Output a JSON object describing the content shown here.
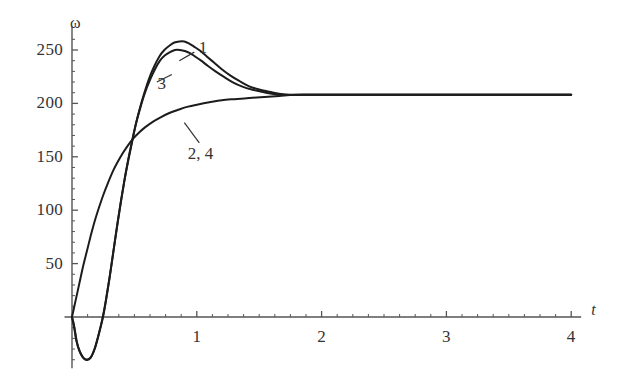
{
  "figure": {
    "background_color": "#ffffff",
    "curve_color": "#1c1c1c",
    "axis_color": "#555555",
    "text_color": "#333333"
  },
  "axes": {
    "y_axis_name": "ω",
    "x_axis_name": "t",
    "y_ticks": [
      {
        "value": 250,
        "label": "250"
      },
      {
        "value": 200,
        "label": "200"
      },
      {
        "value": 150,
        "label": "150"
      },
      {
        "value": 100,
        "label": "100"
      },
      {
        "value": 50,
        "label": "50"
      }
    ],
    "x_ticks": [
      {
        "value": 1,
        "label": "1"
      },
      {
        "value": 2,
        "label": "2"
      },
      {
        "value": 3,
        "label": "3"
      },
      {
        "value": 4,
        "label": "4"
      }
    ],
    "x_minor_tick_step": 0.125,
    "y_minor_tick_step": 10,
    "xlim": [
      -0.06,
      4.08
    ],
    "ylim": [
      -48,
      272
    ],
    "grid": false
  },
  "annotations": [
    {
      "name": "curve-label-1",
      "text": "1",
      "x": 1.05,
      "y": 252
    },
    {
      "name": "curve-label-3",
      "text": "3",
      "x": 0.72,
      "y": 218
    },
    {
      "name": "curve-label-2-4",
      "text": "2, 4",
      "x": 1.03,
      "y": 153
    }
  ],
  "chart_data": {
    "type": "line",
    "title": "",
    "xlabel": "t",
    "ylabel": "ω",
    "xlim": [
      -0.06,
      4.08
    ],
    "ylim": [
      -48,
      272
    ],
    "grid": false,
    "legend_position": "inline-annotations",
    "series": [
      {
        "name": "1",
        "label": "1",
        "points": [
          [
            0.0,
            0
          ],
          [
            0.015,
            -8
          ],
          [
            0.035,
            -22
          ],
          [
            0.06,
            -32
          ],
          [
            0.09,
            -38
          ],
          [
            0.12,
            -40
          ],
          [
            0.15,
            -38
          ],
          [
            0.18,
            -30
          ],
          [
            0.21,
            -18
          ],
          [
            0.245,
            -2
          ],
          [
            0.27,
            14
          ],
          [
            0.3,
            36
          ],
          [
            0.33,
            60
          ],
          [
            0.36,
            84
          ],
          [
            0.39,
            107
          ],
          [
            0.42,
            128
          ],
          [
            0.45,
            147
          ],
          [
            0.48,
            164
          ],
          [
            0.51,
            180
          ],
          [
            0.545,
            196
          ],
          [
            0.58,
            210
          ],
          [
            0.62,
            224
          ],
          [
            0.66,
            235
          ],
          [
            0.7,
            244
          ],
          [
            0.74,
            250
          ],
          [
            0.78,
            254
          ],
          [
            0.82,
            257
          ],
          [
            0.86,
            258
          ],
          [
            0.9,
            258
          ],
          [
            0.94,
            256
          ],
          [
            0.98,
            253
          ],
          [
            1.03,
            249
          ],
          [
            1.08,
            244
          ],
          [
            1.14,
            238
          ],
          [
            1.2,
            232
          ],
          [
            1.27,
            226
          ],
          [
            1.34,
            221
          ],
          [
            1.42,
            216
          ],
          [
            1.5,
            213
          ],
          [
            1.58,
            211
          ],
          [
            1.66,
            209
          ],
          [
            1.75,
            208
          ],
          [
            1.85,
            208
          ],
          [
            1.95,
            208
          ],
          [
            2.1,
            208
          ],
          [
            2.3,
            208
          ],
          [
            2.6,
            208
          ],
          [
            3.0,
            208
          ],
          [
            3.4,
            208
          ],
          [
            3.7,
            208
          ],
          [
            4.0,
            208
          ]
        ]
      },
      {
        "name": "3",
        "label": "3",
        "points": [
          [
            0.0,
            0
          ],
          [
            0.018,
            -9
          ],
          [
            0.04,
            -24
          ],
          [
            0.065,
            -33
          ],
          [
            0.095,
            -39
          ],
          [
            0.125,
            -40
          ],
          [
            0.155,
            -37
          ],
          [
            0.185,
            -29
          ],
          [
            0.215,
            -16
          ],
          [
            0.25,
            2
          ],
          [
            0.275,
            18
          ],
          [
            0.305,
            40
          ],
          [
            0.335,
            64
          ],
          [
            0.365,
            88
          ],
          [
            0.395,
            110
          ],
          [
            0.425,
            131
          ],
          [
            0.455,
            149
          ],
          [
            0.485,
            166
          ],
          [
            0.515,
            182
          ],
          [
            0.55,
            197
          ],
          [
            0.585,
            210
          ],
          [
            0.625,
            222
          ],
          [
            0.665,
            232
          ],
          [
            0.705,
            240
          ],
          [
            0.745,
            245
          ],
          [
            0.785,
            248
          ],
          [
            0.825,
            250
          ],
          [
            0.865,
            250
          ],
          [
            0.905,
            249
          ],
          [
            0.945,
            247
          ],
          [
            0.985,
            244
          ],
          [
            1.035,
            240
          ],
          [
            1.09,
            235
          ],
          [
            1.15,
            230
          ],
          [
            1.215,
            225
          ],
          [
            1.285,
            220
          ],
          [
            1.36,
            216
          ],
          [
            1.44,
            213
          ],
          [
            1.52,
            211
          ],
          [
            1.6,
            209
          ],
          [
            1.7,
            208
          ],
          [
            1.8,
            208
          ],
          [
            1.9,
            208
          ],
          [
            2.1,
            208
          ],
          [
            2.4,
            208
          ],
          [
            2.8,
            208
          ],
          [
            3.2,
            208
          ],
          [
            3.6,
            208
          ],
          [
            4.0,
            208
          ]
        ]
      },
      {
        "name": "2, 4",
        "label": "2, 4",
        "points": [
          [
            0.0,
            0
          ],
          [
            0.03,
            16
          ],
          [
            0.06,
            32
          ],
          [
            0.09,
            48
          ],
          [
            0.12,
            62
          ],
          [
            0.15,
            76
          ],
          [
            0.18,
            89
          ],
          [
            0.215,
            102
          ],
          [
            0.25,
            114
          ],
          [
            0.29,
            126
          ],
          [
            0.33,
            137
          ],
          [
            0.37,
            146
          ],
          [
            0.41,
            154
          ],
          [
            0.45,
            161
          ],
          [
            0.49,
            167
          ],
          [
            0.54,
            173
          ],
          [
            0.59,
            178
          ],
          [
            0.65,
            183
          ],
          [
            0.71,
            187
          ],
          [
            0.78,
            191
          ],
          [
            0.85,
            194
          ],
          [
            0.93,
            197
          ],
          [
            1.01,
            199
          ],
          [
            1.1,
            201
          ],
          [
            1.2,
            203
          ],
          [
            1.3,
            204
          ],
          [
            1.42,
            205
          ],
          [
            1.54,
            206
          ],
          [
            1.66,
            207
          ],
          [
            1.78,
            208
          ],
          [
            1.9,
            208
          ],
          [
            2.05,
            208
          ],
          [
            2.25,
            208
          ],
          [
            2.5,
            208
          ],
          [
            2.8,
            208
          ],
          [
            3.1,
            208
          ],
          [
            3.4,
            208
          ],
          [
            3.7,
            208
          ],
          [
            4.0,
            208
          ]
        ]
      }
    ],
    "leader_lines": [
      {
        "name": "leader-1",
        "from": [
          0.98,
          248
        ],
        "to": [
          0.86,
          240
        ]
      },
      {
        "name": "leader-3",
        "from": [
          0.8,
          227
        ],
        "to": [
          0.68,
          220
        ]
      },
      {
        "name": "leader-2-4",
        "from": [
          1.02,
          163
        ],
        "to": [
          0.9,
          182
        ]
      }
    ],
    "converged_value": 208
  }
}
